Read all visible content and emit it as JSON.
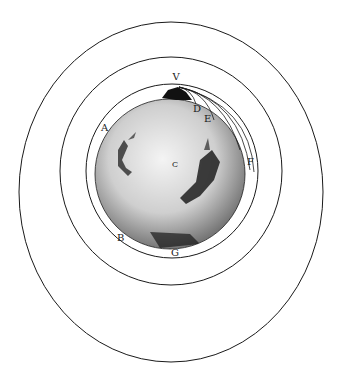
{
  "figure": {
    "labels": {
      "V": "V",
      "D": "D",
      "E": "E",
      "F": "F",
      "A": "A",
      "B": "B",
      "G": "G",
      "C": "C"
    },
    "colors": {
      "ink": "#1a1a1a",
      "background": "#ffffff",
      "earth_shade": "#6b6b6b"
    }
  }
}
